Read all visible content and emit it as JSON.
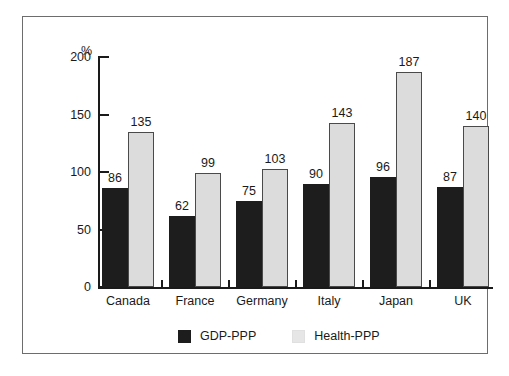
{
  "chart_data": {
    "type": "bar",
    "title": "",
    "subtitle": "",
    "xlabel": "",
    "ylabel": "%",
    "ylim": [
      0,
      200
    ],
    "yticks": [
      0,
      50,
      100,
      150,
      200
    ],
    "ytick_labels": [
      "0",
      "50",
      "100",
      "150",
      "200"
    ],
    "grid": false,
    "legend_position": "bottom-center",
    "categories": [
      "Canada",
      "France",
      "Germany",
      "Italy",
      "Japan",
      "UK"
    ],
    "series": [
      {
        "name": "GDP-PPP",
        "color": "#1d1d1d",
        "values": [
          86,
          62,
          75,
          90,
          96,
          87
        ],
        "value_labels": [
          "86",
          "62",
          "75",
          "90",
          "96",
          "87"
        ]
      },
      {
        "name": "Health-PPP",
        "color": "#dcdcdc",
        "values": [
          135,
          99,
          103,
          143,
          187,
          140
        ],
        "value_labels": [
          "135",
          "99",
          "103",
          "143",
          "187",
          "140"
        ]
      }
    ]
  },
  "axis": {
    "unit_symbol": "%"
  },
  "legend": {
    "items": [
      {
        "label": "GDP-PPP",
        "swatch": "gdp"
      },
      {
        "label": "Health-PPP",
        "swatch": "health"
      }
    ]
  }
}
